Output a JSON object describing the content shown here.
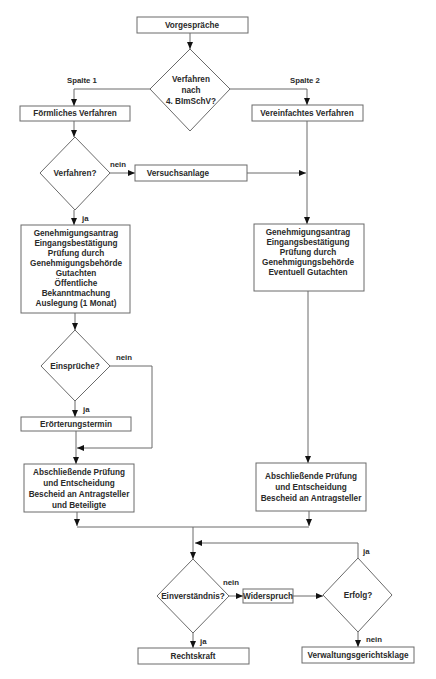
{
  "diagram": {
    "type": "flowchart",
    "nodes": {
      "vorgespraeche": {
        "label": "Vorgespräche",
        "shape": "box"
      },
      "decision_4bimschv": {
        "lines": [
          "Verfahren",
          "nach",
          "4. BImSchV?"
        ],
        "shape": "diamond"
      },
      "foermliches": {
        "label": "Förmliches Verfahren",
        "shape": "box"
      },
      "vereinfachtes": {
        "label": "Vereinfachtes Verfahren",
        "shape": "box"
      },
      "decision_verfahren": {
        "label": "Verfahren?",
        "shape": "diamond"
      },
      "versuchsanlage": {
        "label": "Versuchsanlage",
        "shape": "box"
      },
      "antrag_left": {
        "lines": [
          "Genehmigungsantrag",
          "Eingangsbestätigung",
          "Prüfung durch",
          "Genehmigungsbehörde",
          "Gutachten",
          "Öffentliche",
          "Bekanntmachung",
          "Auslegung (1 Monat)"
        ],
        "shape": "box"
      },
      "antrag_right": {
        "lines": [
          "Genehmigungsantrag",
          "Eingangsbestätigung",
          "Prüfung durch",
          "Genehmigungsbehörde",
          "Eventuell Gutachten"
        ],
        "shape": "box"
      },
      "decision_einsprueche": {
        "label": "Einsprüche?",
        "shape": "diamond"
      },
      "eroerterung": {
        "label": "Erörterungstermin",
        "shape": "box"
      },
      "abschluss_left": {
        "lines": [
          "Abschließende Prüfung",
          "und Entscheidung",
          "Bescheid an Antragsteller",
          "und Beteiligte"
        ],
        "shape": "box"
      },
      "abschluss_right": {
        "lines": [
          "Abschließende Prüfung",
          "und Entscheidung",
          "Bescheid an Antragsteller"
        ],
        "shape": "box"
      },
      "decision_einverstaendnis": {
        "label": "Einverständnis?",
        "shape": "diamond"
      },
      "widerspruch": {
        "label": "Widerspruch",
        "shape": "box"
      },
      "decision_erfolg": {
        "label": "Erfolg?",
        "shape": "diamond"
      },
      "rechtskraft": {
        "label": "Rechtskraft",
        "shape": "box"
      },
      "klage": {
        "label": "Verwaltungsgerichtsklage",
        "shape": "box"
      }
    },
    "labels": {
      "spalte1": "Spalte 1",
      "spalte2": "Spalte 2",
      "nein_verfahren": "nein",
      "ja_verfahren": "ja",
      "nein_einsprueche": "nein",
      "ja_einsprueche": "ja",
      "nein_einverstaendnis": "nein",
      "ja_einverstaendnis": "ja",
      "ja_erfolg": "ja",
      "nein_erfolg": "nein"
    },
    "edges": [
      {
        "from": "vorgespraeche",
        "to": "decision_4bimschv"
      },
      {
        "from": "decision_4bimschv",
        "to": "foermliches",
        "label": "Spalte 1"
      },
      {
        "from": "decision_4bimschv",
        "to": "vereinfachtes",
        "label": "Spalte 2"
      },
      {
        "from": "foermliches",
        "to": "decision_verfahren"
      },
      {
        "from": "decision_verfahren",
        "to": "versuchsanlage",
        "label": "nein"
      },
      {
        "from": "versuchsanlage",
        "to": "antrag_right"
      },
      {
        "from": "vereinfachtes",
        "to": "antrag_right"
      },
      {
        "from": "decision_verfahren",
        "to": "antrag_left",
        "label": "ja"
      },
      {
        "from": "antrag_left",
        "to": "decision_einsprueche"
      },
      {
        "from": "decision_einsprueche",
        "to": "eroerterung",
        "label": "ja"
      },
      {
        "from": "decision_einsprueche",
        "to": "abschluss_left",
        "label": "nein"
      },
      {
        "from": "eroerterung",
        "to": "abschluss_left"
      },
      {
        "from": "antrag_right",
        "to": "abschluss_right"
      },
      {
        "from": "abschluss_left",
        "to": "decision_einverstaendnis"
      },
      {
        "from": "abschluss_right",
        "to": "decision_einverstaendnis"
      },
      {
        "from": "decision_einverstaendnis",
        "to": "widerspruch",
        "label": "nein"
      },
      {
        "from": "widerspruch",
        "to": "decision_erfolg"
      },
      {
        "from": "decision_erfolg",
        "to": "decision_einverstaendnis",
        "label": "ja"
      },
      {
        "from": "decision_einverstaendnis",
        "to": "rechtskraft",
        "label": "ja"
      },
      {
        "from": "decision_erfolg",
        "to": "klage",
        "label": "nein"
      }
    ]
  },
  "caption": ""
}
